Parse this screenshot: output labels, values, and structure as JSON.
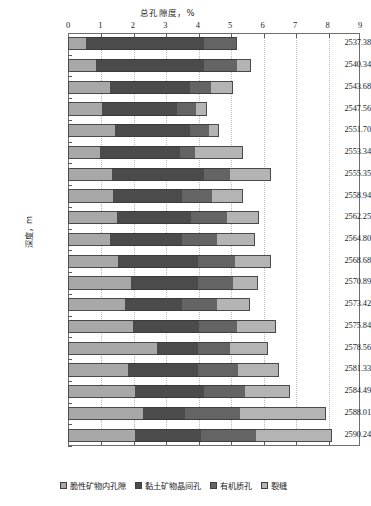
{
  "chart_data": {
    "type": "bar",
    "orientation": "horizontal",
    "stacked": true,
    "title": "总孔隙度，%",
    "xlabel": "总孔隙度，%",
    "ylabel": "深度，m",
    "xlim": [
      0,
      9
    ],
    "xticks": [
      0,
      1,
      2,
      3,
      4,
      5,
      6,
      7,
      8,
      9
    ],
    "xtick_labels": [
      "0",
      "1",
      "2",
      "3",
      "4",
      "5",
      "6",
      "7",
      "8",
      "9"
    ],
    "grid": true,
    "grid_axis": "x",
    "legend_position": "bottom",
    "categories": [
      "2537.38",
      "2540.34",
      "2543.68",
      "2547.56",
      "2551.70",
      "2553.34",
      "2555.35",
      "2558.94",
      "2562.25",
      "2564.80",
      "2568.68",
      "2570.89",
      "2573.42",
      "2575.84",
      "2578.56",
      "2581.33",
      "2584.49",
      "2588.01",
      "2590.24"
    ],
    "series": [
      {
        "name": "脆性矿物内孔隙",
        "color": "#a8a8a8",
        "values": [
          0.55,
          0.85,
          1.3,
          1.05,
          1.45,
          1.0,
          1.35,
          1.4,
          1.5,
          1.3,
          1.55,
          1.95,
          1.75,
          2.0,
          2.75,
          1.85,
          2.05,
          2.3,
          2.05
        ]
      },
      {
        "name": "黏土矿物晶间孔",
        "color": "#4b4b4b",
        "values": [
          3.65,
          3.35,
          2.45,
          2.3,
          2.3,
          2.45,
          2.85,
          2.1,
          2.3,
          2.2,
          2.45,
          2.05,
          1.75,
          2.05,
          1.25,
          2.15,
          2.15,
          1.3,
          2.05
        ]
      },
      {
        "name": "有机质孔",
        "color": "#646464",
        "values": [
          1.0,
          1.0,
          0.65,
          0.6,
          0.6,
          0.45,
          0.8,
          0.95,
          1.1,
          1.1,
          1.15,
          1.1,
          1.1,
          1.15,
          1.0,
          1.25,
          1.25,
          1.7,
          1.7
        ]
      },
      {
        "name": "裂缝",
        "color": "#b4b4b4",
        "values": [
          0.0,
          0.45,
          0.7,
          0.35,
          0.3,
          1.5,
          1.25,
          0.95,
          1.0,
          1.15,
          1.1,
          0.75,
          1.0,
          1.2,
          1.15,
          1.25,
          1.4,
          2.65,
          2.35
        ]
      }
    ]
  },
  "legend": {
    "items": [
      {
        "label": "脆性矿物内孔隙",
        "swatch": "#a8a8a8"
      },
      {
        "label": "黏土矿物晶间孔",
        "swatch": "#4b4b4b"
      },
      {
        "label": "有机质孔",
        "swatch": "#646464"
      },
      {
        "label": "裂缝",
        "swatch": "#b4b4b4"
      }
    ]
  }
}
